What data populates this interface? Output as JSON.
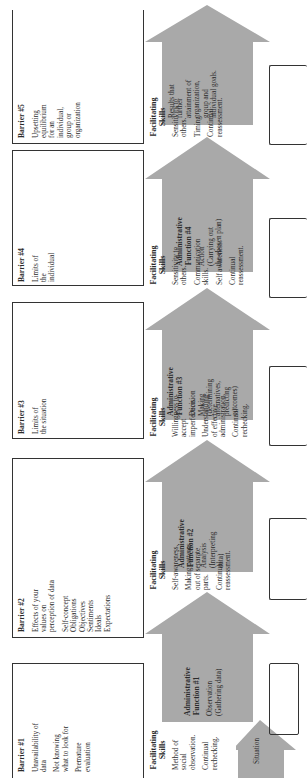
{
  "diagram": {
    "colors": {
      "arrow_fill": "#a9a9a9",
      "box_border": "#333333",
      "text": "#2a2a2a",
      "background": "#ffffff"
    },
    "situation": {
      "label": "Situation"
    },
    "barriers": [
      {
        "title": "Barrier #1",
        "lines": [
          "Unavailability of data",
          "Not knowing what to look for",
          "Premature evaluation"
        ]
      },
      {
        "title": "Barrier #2",
        "lines": [
          "Effects of your values on perception of data",
          "Self-concept Obligations Objectives Sentiments Ideals Expectations"
        ]
      },
      {
        "title": "Barrier #3",
        "lines": [
          "Limits of the situation"
        ]
      },
      {
        "title": "Barrier #4",
        "lines": [
          "Limits of the individual"
        ]
      },
      {
        "title": "Barrier #5",
        "lines": [
          "Upsetting equilibrium for an individual, group or organization"
        ]
      }
    ],
    "facilitating_skills": [
      {
        "title": "Facilitating Skills",
        "items": [
          "Method of social observation.",
          "Continual rechecking."
        ]
      },
      {
        "title": "Facilitating Skills",
        "items": [
          "Self-awareness.",
          "Making patterns out of separate parts.",
          "Continual reassessment."
        ]
      },
      {
        "title": "Facilitating Skills",
        "items": [
          "Willingness to accept imperfection.",
          "Understanding of effective administration.",
          "Continual rechecking."
        ]
      },
      {
        "title": "Facilitating Skills",
        "items": [
          "Sensitivity to others.",
          "Communication skills.",
          "Self awareness.",
          "Continual reassessment."
        ]
      },
      {
        "title": "Facilitating Skills",
        "items": [
          "Sensitivity to others.",
          "Timing.",
          "Continual reassessment."
        ]
      }
    ],
    "administrative_functions": [
      {
        "title": "Administrative Function #1",
        "desc": "Observation (Gathering data)"
      },
      {
        "title": "Administrative Function #2",
        "desc": "Analysis (Interpreting data)"
      },
      {
        "title": "Administrative Function #3",
        "desc": "Decision Making (determining alternatives, predicting outcomes)"
      },
      {
        "title": "Administrative Function #4",
        "desc": "Action (Carrying out the chosen plan)"
      }
    ],
    "results": {
      "desc": "Results that further attainment of organization, group and individual goals."
    }
  }
}
